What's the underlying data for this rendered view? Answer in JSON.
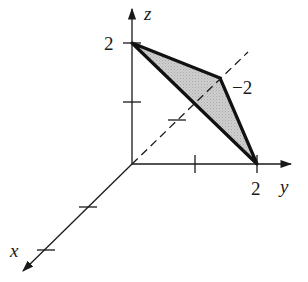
{
  "figure": {
    "type": "3d-coordinate-axes-with-shaded-triangle",
    "axes": {
      "x": {
        "label": "x"
      },
      "y": {
        "label": "y"
      },
      "z": {
        "label": "z"
      }
    },
    "tick_labels": {
      "z_value": "2",
      "y_value": "2",
      "dashed_value": "−2"
    },
    "triangle": {
      "vertices": [
        {
          "name": "A",
          "coords": "(0, 0, 2)"
        },
        {
          "name": "B",
          "coords": "(0, -2, 0) along dashed axis"
        },
        {
          "name": "C",
          "coords": "(0, 2, 0)"
        }
      ],
      "fill_color": "#c8c8c8",
      "edge_color": "#111111"
    },
    "colors": {
      "background": "#ffffff",
      "ink": "#1a1a1a",
      "shade": "#c8c8c8"
    }
  }
}
